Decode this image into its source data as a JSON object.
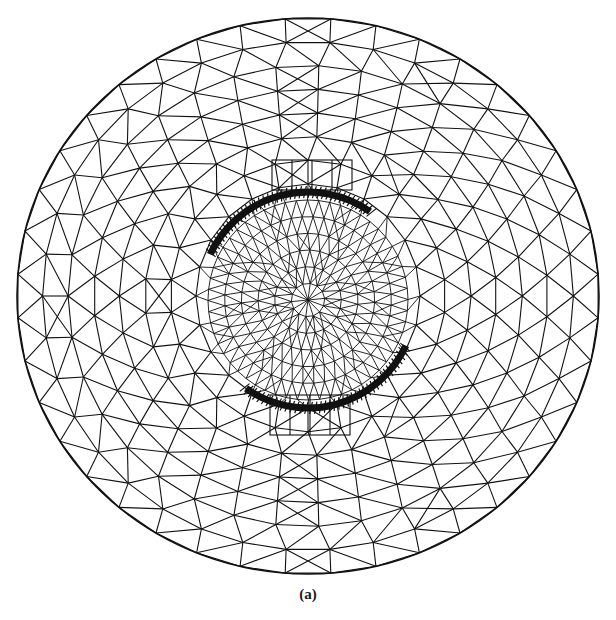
{
  "figure": {
    "caption": "(a)",
    "line_color": "#111111",
    "background": "#ffffff"
  },
  "mesh": {
    "center": [
      308,
      296
    ],
    "outer_rx": 291,
    "outer_ry": 278,
    "outer_rings": 7,
    "outer_nodes_per_ring": 40,
    "inner_radius": 100,
    "inner_rings": 6,
    "inner_nodes_outer": 56,
    "arcs": [
      {
        "name": "top-arc",
        "start_deg": 205,
        "end_deg": 305,
        "radius": 108
      },
      {
        "name": "bottom-arc",
        "start_deg": 25,
        "end_deg": 125,
        "radius": 108
      }
    ],
    "rect_boxes": [
      {
        "name": "top-box",
        "x": 272,
        "y": 160,
        "w": 80,
        "h": 30
      },
      {
        "name": "bottom-box",
        "x": 270,
        "y": 395,
        "w": 80,
        "h": 40
      }
    ]
  }
}
